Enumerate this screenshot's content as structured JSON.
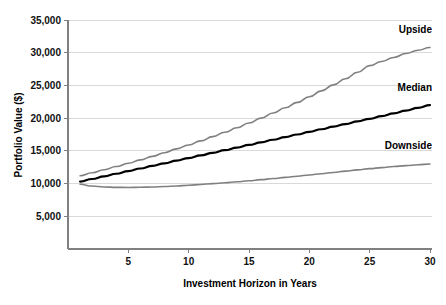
{
  "chart_data": {
    "type": "line",
    "title": "",
    "xlabel": "Investment Horizon in Years",
    "ylabel": "Portfolio Value ($)",
    "xlim": [
      0,
      30
    ],
    "ylim": [
      0,
      35000
    ],
    "grid": true,
    "legend_position": "inline-right",
    "x_ticks": [
      5,
      10,
      15,
      20,
      25,
      30
    ],
    "x_tick_labels": [
      "5",
      "10",
      "15",
      "20",
      "25",
      "30"
    ],
    "y_ticks": [
      5000,
      10000,
      15000,
      20000,
      25000,
      30000,
      35000
    ],
    "y_tick_labels": [
      "5,000",
      "10,000",
      "15,000",
      "20,000",
      "25,000",
      "30,000",
      "35,000"
    ],
    "x": [
      1,
      2,
      3,
      4,
      5,
      6,
      7,
      8,
      9,
      10,
      11,
      12,
      13,
      14,
      15,
      16,
      17,
      18,
      19,
      20,
      21,
      22,
      23,
      24,
      25,
      26,
      27,
      28,
      29,
      30
    ],
    "series": [
      {
        "name": "Upside",
        "color": "#808080",
        "width": 1.6,
        "label_x": 30,
        "label_y": 33000,
        "values": [
          11200,
          11650,
          12120,
          12600,
          13100,
          13620,
          14160,
          14720,
          15300,
          15900,
          16520,
          17170,
          17840,
          18530,
          19250,
          20000,
          20780,
          21580,
          22410,
          23270,
          24160,
          25080,
          26030,
          27010,
          28020,
          28660,
          29280,
          29870,
          30380,
          30800
        ]
      },
      {
        "name": "Median",
        "color": "#000000",
        "width": 2.2,
        "label_x": 30,
        "label_y": 24200,
        "values": [
          10300,
          10700,
          11100,
          11500,
          11900,
          12300,
          12700,
          13100,
          13500,
          13900,
          14300,
          14700,
          15100,
          15500,
          15900,
          16300,
          16700,
          17100,
          17500,
          17900,
          18300,
          18700,
          19100,
          19500,
          19900,
          20320,
          20740,
          21160,
          21580,
          22000
        ]
      },
      {
        "name": "Downside",
        "color": "#808080",
        "width": 1.6,
        "label_x": 30,
        "label_y": 15300,
        "values": [
          9900,
          9620,
          9480,
          9420,
          9410,
          9430,
          9480,
          9550,
          9640,
          9740,
          9860,
          9990,
          10130,
          10280,
          10440,
          10600,
          10770,
          10950,
          11130,
          11320,
          11510,
          11700,
          11900,
          12090,
          12280,
          12440,
          12600,
          12740,
          12880,
          13000
        ]
      }
    ]
  }
}
